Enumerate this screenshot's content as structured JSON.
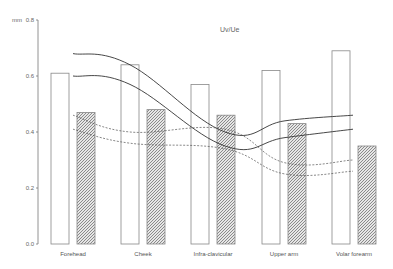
{
  "chart_data": {
    "type": "bar",
    "title": "Uv/Ue",
    "xlabel": "",
    "ylabel": "mm",
    "ylim": [
      0.0,
      0.8
    ],
    "yticks": [
      "0.0",
      "0.2",
      "0.4",
      "0.6",
      "0.8"
    ],
    "grid": false,
    "legend": null,
    "categories": [
      "Forehead",
      "Cheek",
      "Infra-clavicular",
      "Upper arm",
      "Volar forearm"
    ],
    "series": [
      {
        "name": "open bars",
        "style": "white",
        "values": [
          0.61,
          0.64,
          0.57,
          0.62,
          0.69
        ]
      },
      {
        "name": "hatched bars",
        "style": "hatched",
        "values": [
          0.47,
          0.48,
          0.46,
          0.43,
          0.35
        ]
      }
    ],
    "lines": [
      {
        "name": "solid upper",
        "style": "solid",
        "values": [
          0.68,
          0.64,
          0.4,
          0.44,
          0.46
        ]
      },
      {
        "name": "solid lower",
        "style": "solid",
        "values": [
          0.6,
          0.57,
          0.35,
          0.38,
          0.41
        ]
      },
      {
        "name": "dashed upper",
        "style": "dashed",
        "values": [
          0.46,
          0.4,
          0.41,
          0.29,
          0.3
        ]
      },
      {
        "name": "dashed lower",
        "style": "dashed",
        "values": [
          0.41,
          0.36,
          0.34,
          0.25,
          0.26
        ]
      }
    ]
  },
  "axis": {
    "unit": "mm",
    "ticks": [
      {
        "label": "0.0",
        "value": 0.0
      },
      {
        "label": "0.2",
        "value": 0.2
      },
      {
        "label": "0.4",
        "value": 0.4
      },
      {
        "label": "0.6",
        "value": 0.6
      },
      {
        "label": "0.8",
        "value": 0.8
      }
    ]
  },
  "colors": {
    "axis": "#777777",
    "bar_outline": "#888888",
    "hatch": "#999999",
    "line": "#333333"
  }
}
